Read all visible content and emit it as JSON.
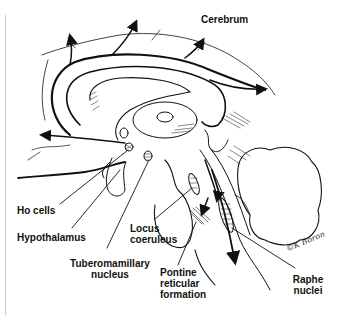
{
  "figure": {
    "labels": {
      "cerebrum": "Cerebrum",
      "ho_cells": "Ho cells",
      "hypothalamus": "Hypothalamus",
      "tuberomamillary_line1": "Tuberomamillary",
      "tuberomamillary_line2": "nucleus",
      "locus_line1": "Locus",
      "locus_line2": "coeruleus",
      "pontine_line1": "Pontine",
      "pontine_line2": "reticular",
      "pontine_line3": "formation",
      "raphe_line1": "Raphe",
      "raphe_line2": "nuclei"
    },
    "signature": "©K Boron",
    "colors": {
      "ink": "#111111",
      "background": "#ffffff",
      "page_edge": "#c8c8c8"
    }
  }
}
